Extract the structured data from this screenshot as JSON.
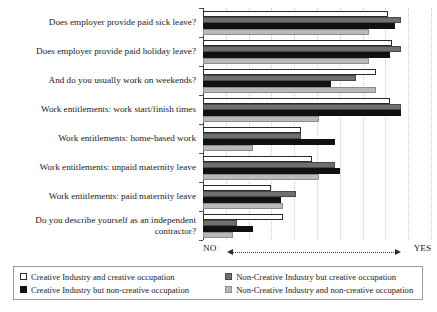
{
  "chart_data": {
    "type": "bar",
    "orientation": "horizontal",
    "title": "",
    "xlabel": "",
    "ylabel": "",
    "axis_annotation": {
      "left": "NO",
      "right": "YES",
      "arrow": "double-headed-dotted"
    },
    "grid": true,
    "xlim": [
      0,
      100
    ],
    "legend_position": "bottom",
    "categories": [
      "Does employer provide paid sick leave?",
      "Does employer provide paid holiday leave?",
      "And do you usually work on weekends?",
      "Work entitlements: work start/finish times",
      "Work entitlements: home-based work",
      "Work entitlements: unpaid maternity leave",
      "Work entitlements: paid maternity leave",
      "Do you describe yourself as an independent contractor?"
    ],
    "series": [
      {
        "name": "Creative Industry and creative occupation",
        "color": "#ffffff",
        "values": [
          81,
          83,
          76,
          82,
          43,
          48,
          30,
          35
        ]
      },
      {
        "name": "Non-Creative Industry but creative occupation",
        "color": "#6f6f6f",
        "values": [
          87,
          87,
          67,
          87,
          43,
          58,
          41,
          15
        ]
      },
      {
        "name": "Creative Industry but non-creative occupation",
        "color": "#111111",
        "values": [
          84,
          82,
          56,
          87,
          58,
          60,
          34,
          22
        ]
      },
      {
        "name": "Non-Creative Industry and non-creative occupation",
        "color": "#b9b9b9",
        "values": [
          73,
          73,
          76,
          51,
          22,
          51,
          35,
          13
        ]
      }
    ]
  },
  "legend": {
    "items": [
      {
        "label": "Creative Industry and creative occupation",
        "swatch": "s0"
      },
      {
        "label": "Non-Creative Industry but creative occupation",
        "swatch": "s1"
      },
      {
        "label": "Creative Industry but non-creative occupation",
        "swatch": "s2"
      },
      {
        "label": "Non-Creative Industry and non-creative occupation",
        "swatch": "s3"
      }
    ]
  }
}
